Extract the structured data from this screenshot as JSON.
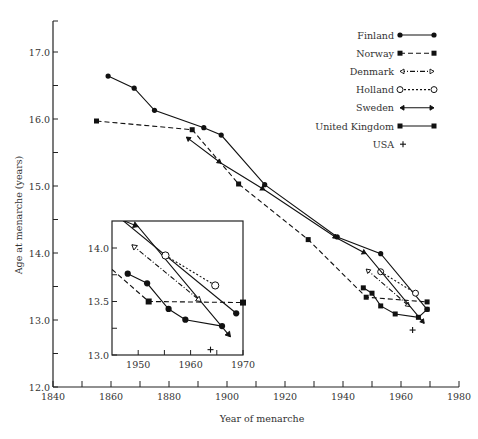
{
  "chart_data": {
    "type": "line",
    "title": "",
    "xlabel": "Year of menarche",
    "ylabel": "Age at menarche (years)",
    "xlim": [
      1840,
      1980
    ],
    "ylim": [
      12.0,
      17.45
    ],
    "xticks": [
      1840,
      1850,
      1860,
      1870,
      1880,
      1890,
      1900,
      1910,
      1920,
      1930,
      1940,
      1950,
      1960,
      1970,
      1980
    ],
    "xtick_labels": [
      "1840",
      "1860",
      "1880",
      "1900",
      "1920",
      "1940",
      "1960",
      "1980"
    ],
    "xtick_label_values": [
      1840,
      1860,
      1880,
      1900,
      1920,
      1940,
      1960,
      1980
    ],
    "yticks": [
      12.0,
      12.5,
      13.0,
      13.5,
      14.0,
      14.5,
      15.0,
      15.5,
      16.0,
      16.5,
      17.0
    ],
    "ytick_labels": [
      "12.0",
      "13.0",
      "14.0",
      "15.0",
      "16.0",
      "17.0"
    ],
    "ytick_label_values": [
      12.0,
      13.0,
      14.0,
      15.0,
      16.0,
      17.0
    ],
    "grid": false,
    "legend_position": "top-right",
    "legend": [
      {
        "name": "Finland",
        "style": "solid",
        "marker": "circle-filled"
      },
      {
        "name": "Norway",
        "style": "dashed",
        "marker": "square-filled"
      },
      {
        "name": "Denmark",
        "style": "dashdot",
        "marker": "arrow-open"
      },
      {
        "name": "Holland",
        "style": "dotted",
        "marker": "circle-open"
      },
      {
        "name": "Sweden",
        "style": "solid",
        "marker": "arrow-filled"
      },
      {
        "name": "United Kingdom",
        "style": "solid",
        "marker": "square-filled"
      },
      {
        "name": "USA",
        "style": "none",
        "marker": "plus"
      }
    ],
    "series": [
      {
        "name": "Finland",
        "x": [
          1859,
          1868,
          1875,
          1892,
          1898,
          1913,
          1938,
          1953,
          1969
        ],
        "y": [
          16.64,
          16.46,
          16.13,
          15.87,
          15.76,
          15.02,
          14.24,
          13.99,
          13.16
        ]
      },
      {
        "name": "Norway",
        "x": [
          1855,
          1888,
          1904,
          1928,
          1948,
          1969
        ],
        "y": [
          15.97,
          15.84,
          15.03,
          14.2,
          13.34,
          13.27
        ]
      },
      {
        "name": "Denmark",
        "x": [
          1948,
          1963
        ],
        "y": [
          13.76,
          13.2
        ]
      },
      {
        "name": "Holland",
        "x": [
          1953,
          1965
        ],
        "y": [
          13.72,
          13.4
        ]
      },
      {
        "name": "Sweden",
        "x": [
          1886,
          1898,
          1913,
          1938,
          1948,
          1968
        ],
        "y": [
          15.73,
          15.34,
          14.94,
          14.22,
          13.99,
          12.95
        ]
      },
      {
        "name": "United Kingdom",
        "x": [
          1947,
          1950,
          1953,
          1958,
          1966,
          1969
        ],
        "y": [
          13.48,
          13.4,
          13.21,
          13.09,
          13.04,
          13.16
        ]
      },
      {
        "name": "USA",
        "x": [
          1964
        ],
        "y": [
          12.85
        ]
      }
    ],
    "inset": {
      "xlim": [
        1945,
        1970
      ],
      "ylim": [
        13.0,
        14.26
      ],
      "xticks": [
        1950,
        1955,
        1960,
        1965,
        1970
      ],
      "xtick_labels": [
        "1950",
        "1960",
        "1970"
      ],
      "xtick_label_values": [
        1950,
        1960,
        1970
      ],
      "yticks": [
        13.0,
        13.25,
        13.5,
        13.75,
        14.0
      ],
      "ytick_labels": [
        "13.0",
        "13.5",
        "14.0"
      ],
      "ytick_label_values": [
        13.0,
        13.5,
        14.0
      ],
      "series": [
        {
          "name": "Sweden",
          "x": [
            1947,
            1950,
            1967.6
          ],
          "y": [
            14.26,
            14.2,
            13.17
          ]
        },
        {
          "name": "Finland",
          "x": [
            1947,
            1968.7
          ],
          "y": [
            14.26,
            13.39
          ]
        },
        {
          "name": "Denmark",
          "x": [
            1948.8,
            1962
          ],
          "y": [
            14.03,
            13.5
          ]
        },
        {
          "name": "Holland",
          "x": [
            1955.2,
            1964.7
          ],
          "y": [
            13.93,
            13.65
          ]
        },
        {
          "name": "Norway",
          "x": [
            1945,
            1952,
            1970
          ],
          "y": [
            13.8,
            13.5,
            13.49
          ]
        },
        {
          "name": "United Kingdom",
          "x": [
            1948,
            1951.7,
            1955.8,
            1959,
            1966
          ],
          "y": [
            13.76,
            13.67,
            13.43,
            13.33,
            13.27
          ]
        },
        {
          "name": "USA",
          "x": [
            1963.8
          ],
          "y": [
            13.05
          ]
        }
      ]
    }
  }
}
